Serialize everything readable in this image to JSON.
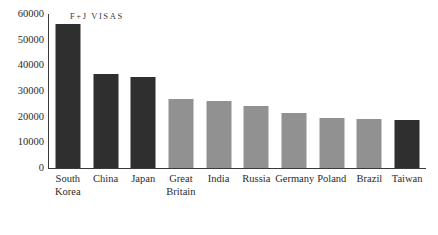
{
  "chart_data": {
    "type": "bar",
    "title": "F+J VISAS",
    "xlabel": "",
    "ylabel": "",
    "ylim": [
      0,
      60000
    ],
    "grid": false,
    "legend": "none",
    "ytick_labels": [
      "60000",
      "50000",
      "40000",
      "30000",
      "20000",
      "10000",
      "0"
    ],
    "ytick_values": [
      60000,
      50000,
      40000,
      30000,
      20000,
      10000,
      0
    ],
    "categories": [
      "South Korea",
      "China",
      "Japan",
      "Great Britain",
      "India",
      "Russia",
      "Germany",
      "Poland",
      "Brazil",
      "Taiwan"
    ],
    "category_label_lines": [
      [
        "South",
        "Korea"
      ],
      [
        "China"
      ],
      [
        "Japan"
      ],
      [
        "Great",
        "Britain"
      ],
      [
        "India"
      ],
      [
        "Russia"
      ],
      [
        "Germany"
      ],
      [
        "Poland"
      ],
      [
        "Brazil"
      ],
      [
        "Taiwan"
      ]
    ],
    "values": [
      56000,
      36500,
      35500,
      26800,
      26000,
      24300,
      21600,
      19500,
      19200,
      18600
    ],
    "bar_shades": [
      "dark",
      "dark",
      "dark",
      "light",
      "light",
      "light",
      "light",
      "light",
      "light",
      "dark"
    ],
    "colors": {
      "dark_bar": "#2f2f2f",
      "light_bar": "#919191",
      "axis": "#3a3a3a",
      "text": "#2b2b2b",
      "background": "#ffffff"
    }
  }
}
